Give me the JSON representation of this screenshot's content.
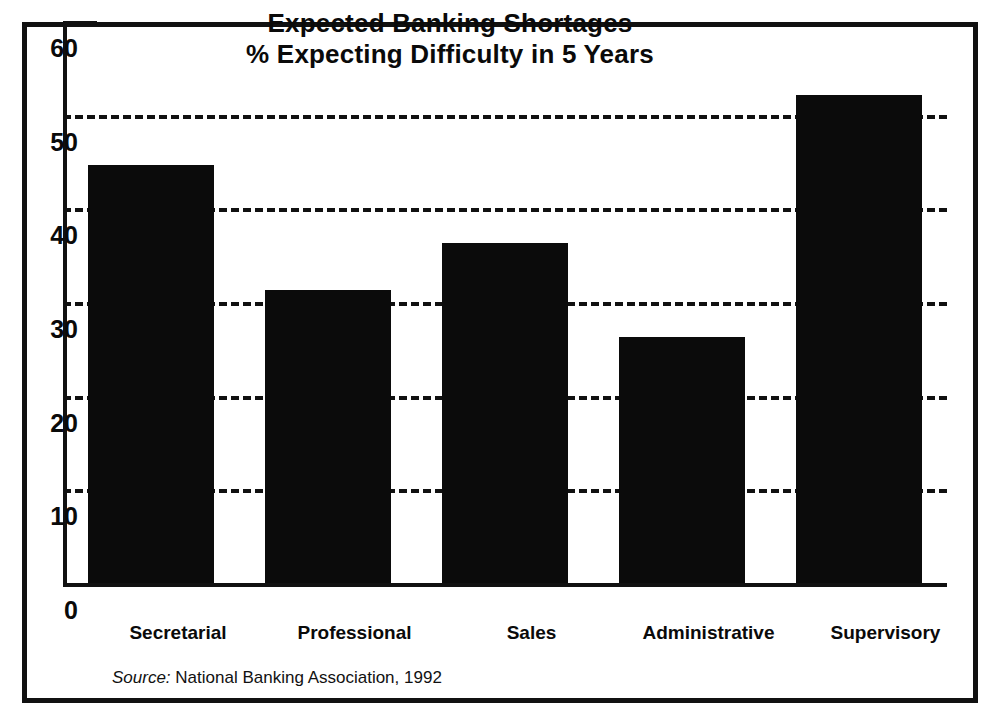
{
  "chart_data": {
    "type": "bar",
    "title": "Expected Banking Shortages",
    "subtitle": "% Expecting Difficulty in 5 Years",
    "xlabel": "",
    "ylabel": "",
    "categories": [
      "Secretarial",
      "Professional",
      "Sales",
      "Administrative",
      "Supervisory"
    ],
    "values": [
      44.6,
      31.3,
      36.3,
      26.3,
      52.1
    ],
    "series": [
      {
        "name": "% Expecting Difficulty in 5 Years",
        "values": [
          44.6,
          31.3,
          36.3,
          26.3,
          52.1
        ]
      }
    ],
    "ylim": [
      0,
      60
    ],
    "yticks": [
      0,
      10,
      20,
      30,
      40,
      50,
      60
    ],
    "ytick_labels": [
      "0",
      "10",
      "20",
      "30",
      "40",
      "50",
      "60"
    ],
    "gridlines": [
      10,
      20,
      30,
      40,
      50
    ],
    "grid": true,
    "grid_style": "dashed-horizontal",
    "legend": false,
    "legend_position": "none",
    "bar_color": "#0b0b0b",
    "background_color": "#ffffff",
    "axis_color": "#111111",
    "frame_color": "#111111",
    "source_label": "Source:",
    "source_text": "National Banking Association, 1992"
  },
  "title": {
    "line1": "Expected Banking Shortages",
    "line2": "% Expecting Difficulty in 5 Years"
  },
  "axis": {
    "y": {
      "t60": "60",
      "t50": "50",
      "t40": "40",
      "t30": "30",
      "t20": "20",
      "t10": "10",
      "t0": "0"
    },
    "x": {
      "c0": "Secretarial",
      "c1": "Professional",
      "c2": "Sales",
      "c3": "Administrative",
      "c4": "Supervisory"
    }
  },
  "footer": {
    "source_label": "Source:",
    "source_text": "National Banking Association, 1992"
  }
}
